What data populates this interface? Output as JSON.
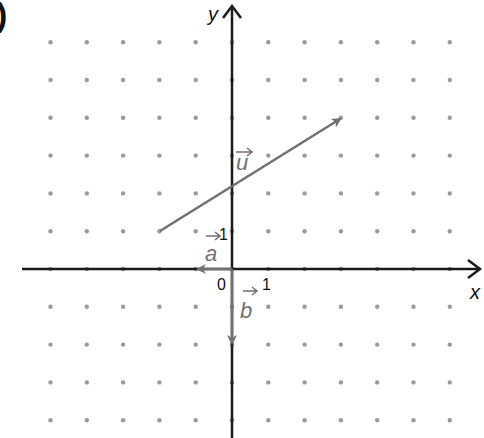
{
  "figure": {
    "corner_mark": ")",
    "axes": {
      "x_label": "x",
      "y_label": "y",
      "origin_label": "0",
      "x_tick_label": "1",
      "y_tick_label": "1",
      "axis_color": "#1a1a1a"
    },
    "grid": {
      "type": "dot-grid",
      "x_range": [
        -5,
        6
      ],
      "y_range": [
        -4,
        6
      ],
      "dot_color": "#9a9a9a"
    },
    "vectors": [
      {
        "name": "u",
        "label": "u",
        "from": [
          -2,
          1
        ],
        "to": [
          3,
          4
        ],
        "color": "#707070"
      },
      {
        "name": "a",
        "label": "a",
        "from": [
          0,
          0
        ],
        "to": [
          -1,
          0
        ],
        "color": "#707070"
      },
      {
        "name": "b",
        "label": "b",
        "from": [
          0,
          0
        ],
        "to": [
          0,
          -2
        ],
        "color": "#707070"
      }
    ]
  }
}
